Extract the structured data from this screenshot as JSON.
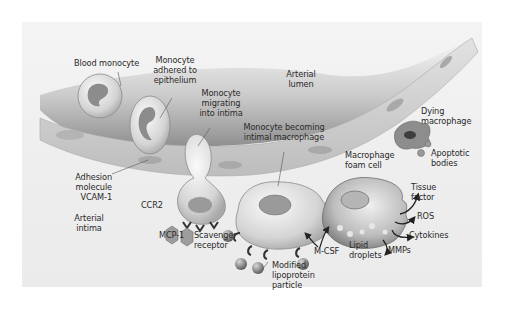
{
  "diagram": {
    "regions": {
      "lumen": "Arterial lumen",
      "intima": "Arterial intima"
    },
    "labels": {
      "blood_monocyte": "Blood monocyte",
      "monocyte_adhered": [
        "Monocyte",
        "adhered to",
        "epithelium"
      ],
      "monocyte_migrating": [
        "Monocyte",
        "migrating",
        "into intima"
      ],
      "monocyte_becoming": [
        "Monocyte becoming",
        "intimal macrophage"
      ],
      "adhesion_molecule": [
        "Adhesion",
        "molecule",
        "VCAM-1"
      ],
      "arterial_lumen": [
        "Arterial",
        "lumen"
      ],
      "arterial_intima": [
        "Arterial",
        "intima"
      ],
      "ccr2": "CCR2",
      "mcp1": "MCP-1",
      "scavenger_receptor": [
        "Scavenger",
        "receptor"
      ],
      "modified_lipoprotein": [
        "Modified",
        "lipoprotein",
        "particle"
      ],
      "mcsf": "M-CSF",
      "lipid_droplets": [
        "Lipid",
        "droplets"
      ],
      "macrophage_foam_cell": [
        "Macrophage",
        "foam cell"
      ],
      "dying_macrophage": [
        "Dying",
        "macrophage"
      ],
      "apoptotic_bodies": [
        "Apoptotic",
        "bodies"
      ],
      "tissue_factor": [
        "Tissue",
        "factor"
      ],
      "ros": "ROS",
      "cytokines": "Cytokines",
      "mmps": "MMPs"
    },
    "colors": {
      "background": "#ffffff",
      "panel": "#efefef",
      "endothelium": "#cfcfcf",
      "lumen_shadow": "#9a9a9a",
      "cell_body": "#d9d9d9",
      "nucleus": "#8c8c8c",
      "text": "#2a2a2a"
    }
  }
}
